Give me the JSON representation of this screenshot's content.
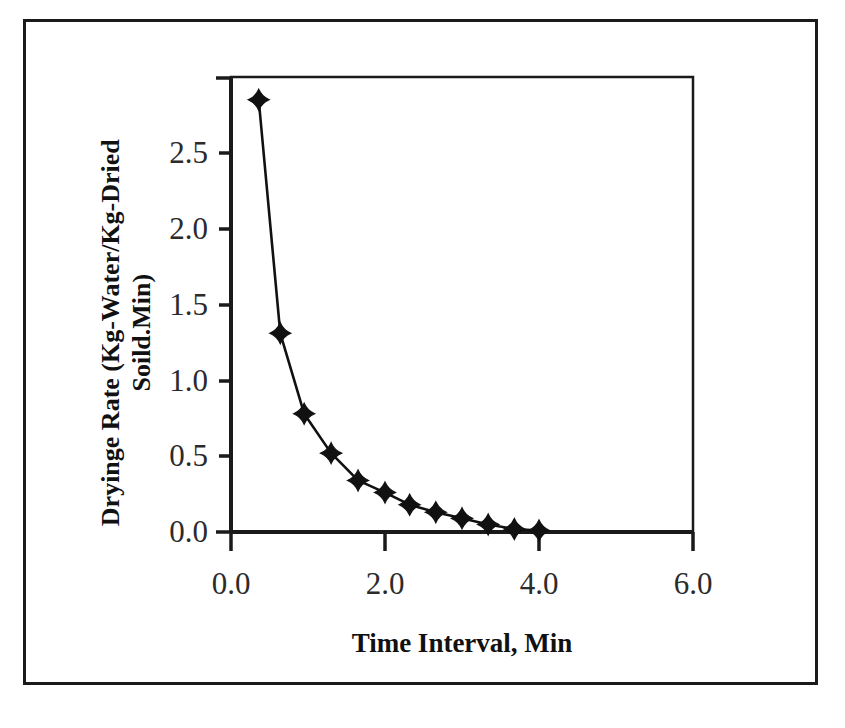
{
  "chart_data": {
    "type": "line",
    "title": "",
    "xlabel": "Time Interval, Min",
    "ylabel": "Dryinge Rate (Kg-Water/Kg-Dried Soild.Min)",
    "ylabel_line1": "Dryinge Rate (Kg-Water/Kg-Dried",
    "ylabel_line2": "Soild.Min)",
    "xlim": [
      0.0,
      6.0
    ],
    "ylim": [
      0.0,
      3.0
    ],
    "xticks": [
      0.0,
      2.0,
      4.0,
      6.0
    ],
    "xtick_labels": [
      "0.0",
      "2.0",
      "4.0",
      "6.0"
    ],
    "yticks": [
      0.0,
      0.5,
      1.0,
      1.5,
      2.0,
      2.5,
      3.0
    ],
    "ytick_labels": [
      "0.0",
      "0.5",
      "1.0",
      "1.5",
      "2.0",
      "2.5",
      ""
    ],
    "grid": false,
    "legend": false,
    "marker": "diamond",
    "marker_color": "#111111",
    "line_color": "#111111",
    "axis_color": "#1a1a1a",
    "background": "#ffffff",
    "series": [
      {
        "name": "Drying Rate",
        "x": [
          0.36,
          0.64,
          0.95,
          1.3,
          1.65,
          2.0,
          2.32,
          2.66,
          3.0,
          3.34,
          3.68,
          4.0
        ],
        "y": [
          2.85,
          1.31,
          0.78,
          0.52,
          0.34,
          0.26,
          0.18,
          0.13,
          0.09,
          0.05,
          0.02,
          0.01
        ]
      }
    ]
  },
  "figure": {
    "frame_visible": true,
    "frame_color": "#1a1a1a"
  }
}
